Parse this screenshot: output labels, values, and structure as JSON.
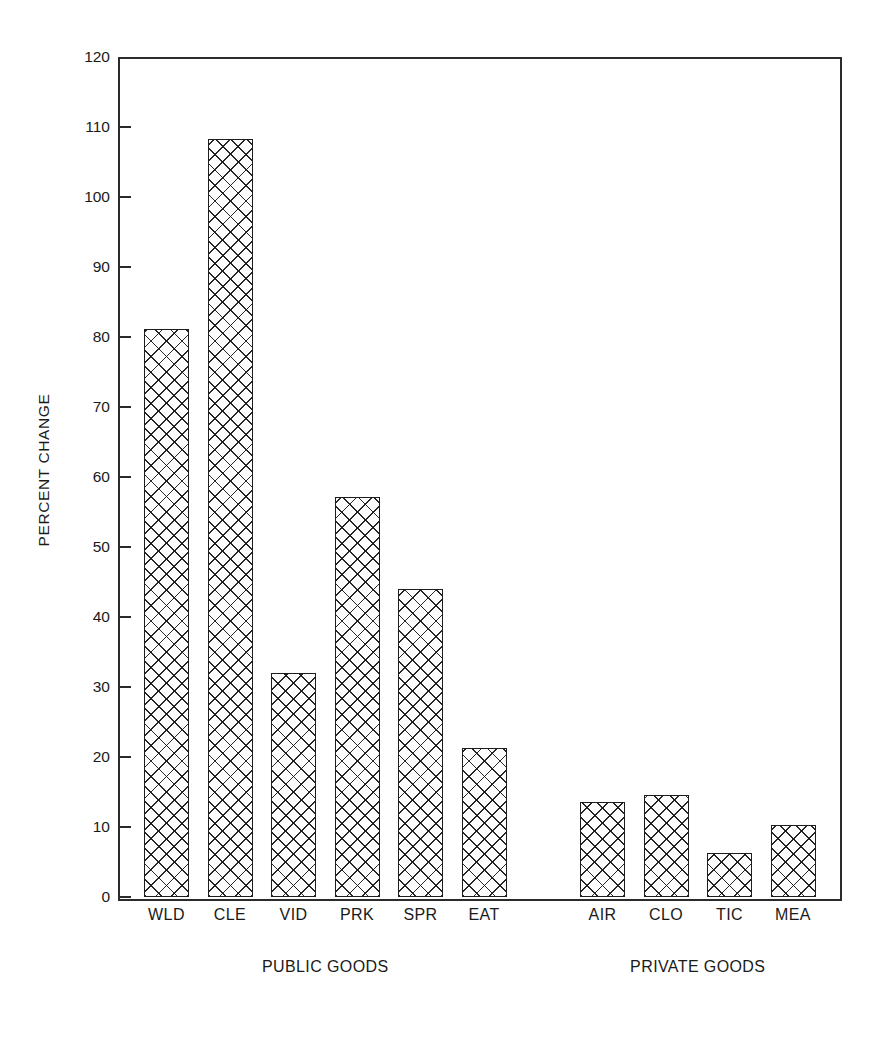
{
  "chart_data": {
    "type": "bar",
    "title": "",
    "xlabel": "",
    "ylabel": "PERCENT CHANGE",
    "ylim": [
      0,
      120
    ],
    "ytick_step": 10,
    "yticks": [
      0,
      10,
      20,
      30,
      40,
      50,
      60,
      70,
      80,
      90,
      100,
      110,
      120
    ],
    "grid": false,
    "legend": null,
    "categories": [
      "WLD",
      "CLE",
      "VID",
      "PRK",
      "SPR",
      "EAT",
      "AIR",
      "CLO",
      "TIC",
      "MEA"
    ],
    "values": [
      81.2,
      108.3,
      32.0,
      57.1,
      44.0,
      21.3,
      13.6,
      14.6,
      6.3,
      10.3
    ],
    "groups": [
      {
        "label": "PUBLIC GOODS",
        "categories": [
          "WLD",
          "CLE",
          "VID",
          "PRK",
          "SPR",
          "EAT"
        ]
      },
      {
        "label": "PRIVATE GOODS",
        "categories": [
          "AIR",
          "CLO",
          "TIC",
          "MEA"
        ]
      }
    ],
    "bar_style": {
      "fill": "#fdfdfd",
      "edge": "#1d1d1d",
      "hatch": "crosshatch"
    },
    "axis_color": "#2b2b2b"
  },
  "axis": {
    "y_title": "PERCENT CHANGE",
    "y_tick_labels": [
      "120",
      "110",
      "100",
      "90",
      "80",
      "70",
      "60",
      "50",
      "40",
      "30",
      "20",
      "10",
      "0"
    ]
  },
  "categories": [
    {
      "label": "WLD",
      "value": 81.2
    },
    {
      "label": "CLE",
      "value": 108.3
    },
    {
      "label": "VID",
      "value": 32.0
    },
    {
      "label": "PRK",
      "value": 57.1
    },
    {
      "label": "SPR",
      "value": 44.0
    },
    {
      "label": "EAT",
      "value": 21.3
    },
    {
      "label": "AIR",
      "value": 13.6
    },
    {
      "label": "CLO",
      "value": 14.6
    },
    {
      "label": "TIC",
      "value": 6.3
    },
    {
      "label": "MEA",
      "value": 10.3
    }
  ],
  "groups": [
    {
      "label": "PUBLIC GOODS"
    },
    {
      "label": "PRIVATE GOODS"
    }
  ]
}
